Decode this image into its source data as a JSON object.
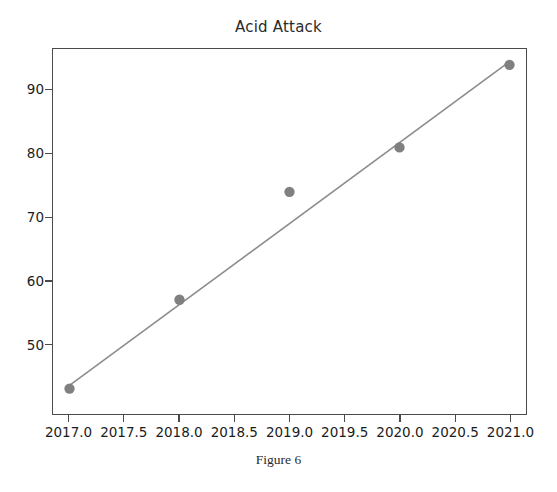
{
  "chart_data": {
    "type": "scatter",
    "title": "Acid Attack",
    "caption": "Figure 6",
    "xlabel": "",
    "ylabel": "",
    "x": [
      2017.0,
      2018.0,
      2019.0,
      2020.0,
      2021.0
    ],
    "values": [
      43,
      57,
      74,
      81,
      94
    ],
    "series": [
      {
        "name": "Acid Attack",
        "x": [
          2017.0,
          2018.0,
          2019.0,
          2020.0,
          2021.0
        ],
        "values": [
          43,
          57,
          74,
          81,
          94
        ],
        "marker": "circle",
        "color": "#808080"
      },
      {
        "name": "trendline",
        "type": "line",
        "x": [
          2017.0,
          2021.0
        ],
        "values": [
          43.5,
          94.5
        ],
        "color": "#8c8c8c"
      }
    ],
    "xlim": [
      2016.85,
      2021.15
    ],
    "ylim": [
      39.0,
      96.5
    ],
    "x_ticks": [
      2017.0,
      2017.5,
      2018.0,
      2018.5,
      2019.0,
      2019.5,
      2020.0,
      2020.5,
      2021.0
    ],
    "x_tick_labels": [
      "2017.0",
      "2017.5",
      "2018.0",
      "2018.5",
      "2019.0",
      "2019.5",
      "2020.0",
      "2020.5",
      "2021.0"
    ],
    "y_ticks": [
      50,
      60,
      70,
      80,
      90
    ],
    "y_tick_labels": [
      "50",
      "60",
      "70",
      "80",
      "90"
    ],
    "grid": false,
    "legend": false,
    "point_color": "#808080",
    "line_color": "#8c8c8c",
    "frame_color": "#4a4a4a",
    "background": "#ffffff"
  }
}
